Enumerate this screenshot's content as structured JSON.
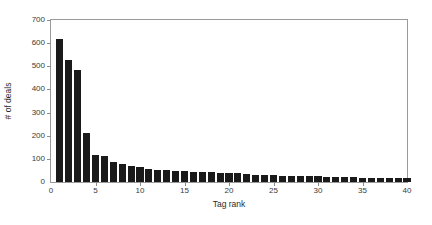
{
  "chart_data": {
    "type": "bar",
    "title": "",
    "xlabel": "Tag rank",
    "ylabel": "# of deals",
    "xlim": [
      0,
      40
    ],
    "ylim": [
      0,
      700
    ],
    "xticks": [
      0,
      5,
      10,
      15,
      20,
      25,
      30,
      35,
      40
    ],
    "yticks": [
      0,
      100,
      200,
      300,
      400,
      500,
      600,
      700
    ],
    "xticklabels": [
      "0",
      "5",
      "10",
      "15",
      "20",
      "25",
      "30",
      "35",
      "40"
    ],
    "yticklabels": [
      "0",
      "100",
      "200",
      "300",
      "400",
      "500",
      "600",
      "700"
    ],
    "grid": false,
    "legend": null,
    "bar_color": "#1a1a1a",
    "axes_color": "#9a9a9a",
    "categories": [
      1,
      2,
      3,
      4,
      5,
      6,
      7,
      8,
      9,
      10,
      11,
      12,
      13,
      14,
      15,
      16,
      17,
      18,
      19,
      20,
      21,
      22,
      23,
      24,
      25,
      26,
      27,
      28,
      29,
      30,
      31,
      32,
      33,
      34,
      35,
      36,
      37,
      38,
      39,
      40
    ],
    "values": [
      620,
      528,
      482,
      210,
      115,
      114,
      88,
      80,
      70,
      65,
      58,
      54,
      54,
      47,
      46,
      43,
      42,
      42,
      39,
      38,
      37,
      35,
      32,
      32,
      30,
      28,
      27,
      26,
      25,
      24,
      23,
      22,
      21,
      20,
      19,
      18,
      17,
      17,
      16,
      16
    ],
    "series_name": "# of deals"
  },
  "figure": {
    "background": "#ffffff"
  }
}
